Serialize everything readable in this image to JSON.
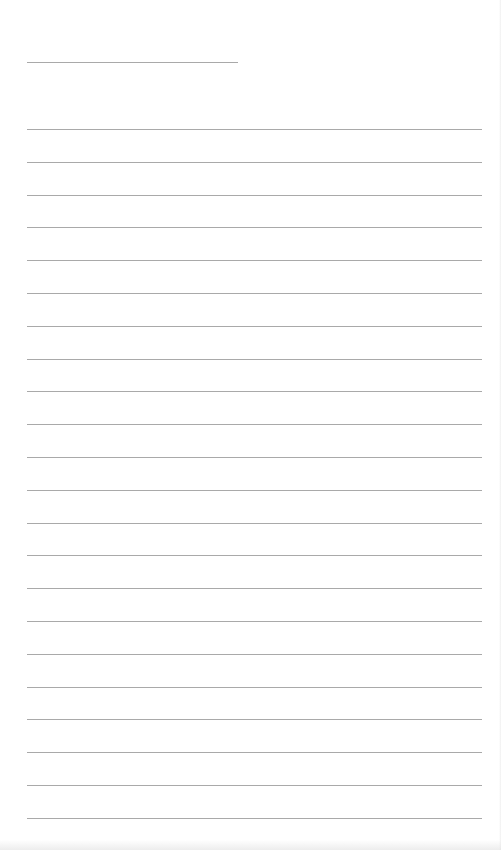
{
  "document": {
    "type": "lined-notepaper",
    "title_line": {
      "x": 27,
      "y": 62,
      "width": 211
    },
    "ruled_lines": {
      "count": 22,
      "x": 27,
      "width": 455,
      "first_y": 129,
      "spacing": 32.8
    },
    "line_color": "#9a9a9a",
    "background_color": "#ffffff",
    "text": []
  }
}
